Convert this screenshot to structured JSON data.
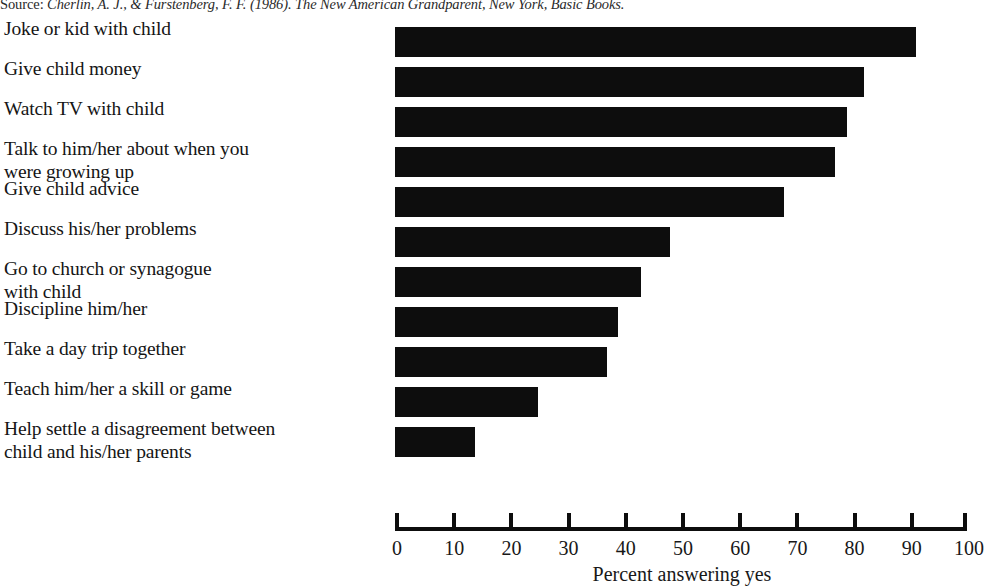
{
  "source": {
    "prefix": "Source:",
    "citation": " Cherlin, A. J., & Furstenberg, F. F. (1986). The New American Grandparent, New York, Basic Books."
  },
  "chart_data": {
    "type": "bar",
    "orientation": "horizontal",
    "title": "",
    "xlabel": "Percent answering yes",
    "ylabel": "",
    "xlim": [
      0,
      100
    ],
    "xticks": [
      "0",
      "10",
      "20",
      "30",
      "40",
      "50",
      "60",
      "70",
      "80",
      "90",
      "100"
    ],
    "grid": false,
    "legend": false,
    "bar_color": "#0d0d0d",
    "categories": [
      "Joke or kid with child",
      "Give child money",
      "Watch TV with child",
      "Talk to him/her about when you were growing up",
      "Give child advice",
      "Discuss his/her problems",
      "Go to church or synagogue with child",
      "Discipline him/her",
      "Take a day trip together",
      "Teach him/her a skill or game",
      "Help settle a disagreement between child and his/her parents"
    ],
    "category_lines": [
      [
        "Joke or kid with child"
      ],
      [
        "Give child money"
      ],
      [
        "Watch TV with child"
      ],
      [
        "Talk to him/her about when you",
        "were growing up"
      ],
      [
        "Give child advice"
      ],
      [
        "Discuss his/her problems"
      ],
      [
        "Go to church or synagogue",
        "with child"
      ],
      [
        "Discipline him/her"
      ],
      [
        "Take a day trip together"
      ],
      [
        "Teach him/her a skill or game"
      ],
      [
        "Help settle a disagreement between",
        "child and his/her parents"
      ]
    ],
    "values": [
      91,
      82,
      79,
      77,
      68,
      48,
      43,
      39,
      37,
      25,
      14
    ]
  }
}
